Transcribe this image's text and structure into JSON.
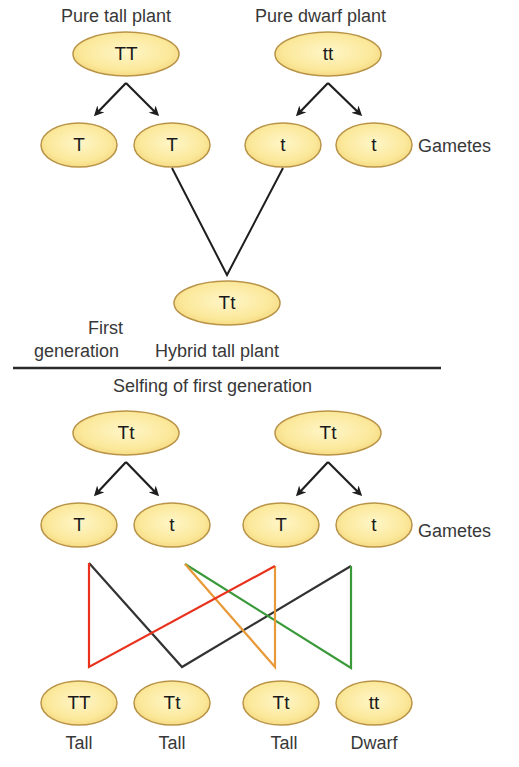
{
  "colors": {
    "ellipse_fill": "#fbe89a",
    "ellipse_stroke": "#b99448",
    "arrow": "#1e1e1e",
    "cross_red": "#e8321e",
    "cross_black": "#333333",
    "cross_orange": "#e89a3a",
    "cross_green": "#3a9a3a"
  },
  "top": {
    "parent_left_label": "Pure tall plant",
    "parent_right_label": "Pure dwarf plant",
    "parent_left": "TT",
    "parent_right": "tt",
    "gametes": [
      "T",
      "T",
      "t",
      "t"
    ],
    "gametes_label": "Gametes",
    "hybrid": "Tt",
    "generation_label_line1": "First",
    "generation_label_line2": "generation",
    "hybrid_label": "Hybrid tall plant"
  },
  "divider_caption": "Selfing of first generation",
  "bottom": {
    "parent_left": "Tt",
    "parent_right": "Tt",
    "gametes": [
      "T",
      "t",
      "T",
      "t"
    ],
    "gametes_label": "Gametes",
    "offspring": [
      {
        "genotype": "TT",
        "phenotype": "Tall"
      },
      {
        "genotype": "Tt",
        "phenotype": "Tall"
      },
      {
        "genotype": "Tt",
        "phenotype": "Tall"
      },
      {
        "genotype": "tt",
        "phenotype": "Dwarf"
      }
    ]
  }
}
